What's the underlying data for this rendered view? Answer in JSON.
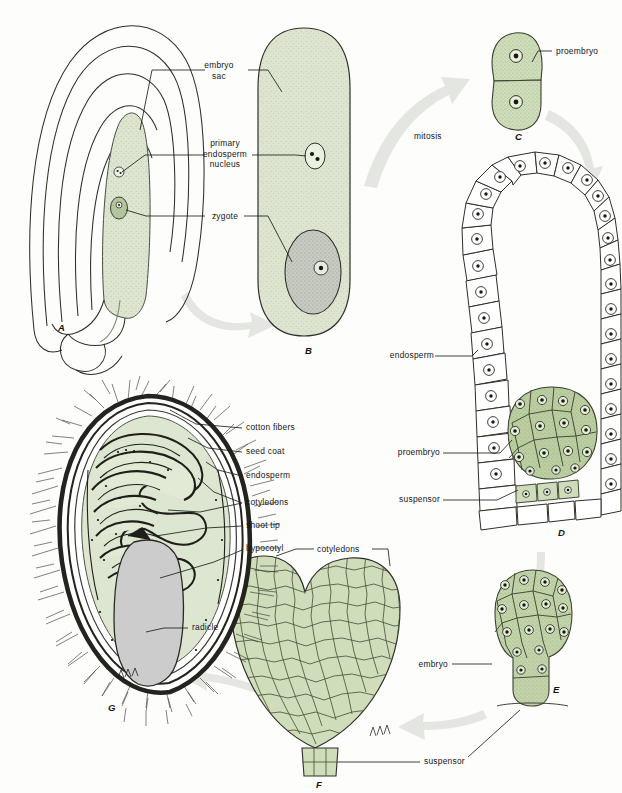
{
  "figure": {
    "domain": "biological-diagram"
  },
  "palette": {
    "cell_green": "#d5e0c4",
    "cell_green_dark": "#b8c9a0",
    "outline": "#2b2b22",
    "arrow_gray": "#e2e5df",
    "stipple": "#7a8c66",
    "radicle_gray": "#c9c9c9",
    "zygote_gray": "#c6c9c2",
    "background": "#fdfdfc",
    "text": "#15171a"
  },
  "stages": [
    {
      "id": "A",
      "letter": "A",
      "x": 58,
      "y": 322,
      "caption": "ovule with embryo sac"
    },
    {
      "id": "B",
      "letter": "B",
      "x": 305,
      "y": 345,
      "caption": "embryo sac enlarged"
    },
    {
      "id": "C",
      "letter": "C",
      "x": 515,
      "y": 131,
      "caption": "two-celled proembryo"
    },
    {
      "id": "D",
      "letter": "D",
      "x": 558,
      "y": 537,
      "caption": "proembryo within endosperm"
    },
    {
      "id": "E",
      "letter": "E",
      "x": 553,
      "y": 691,
      "caption": "globular embryo"
    },
    {
      "id": "F",
      "letter": "F",
      "x": 331,
      "y": 782,
      "caption": "heart-stage embryo"
    },
    {
      "id": "G",
      "letter": "G",
      "x": 108,
      "y": 706,
      "caption": "mature cotton seed"
    }
  ],
  "arrow_labels": [
    {
      "name": "mitosis",
      "text": "mitosis",
      "x": 414,
      "y": 135
    }
  ],
  "labels": [
    {
      "name": "embryo-sac",
      "text": "embryo\nsac",
      "lines": [
        "embryo",
        "sac"
      ],
      "x": 218,
      "y": 66,
      "align": "center"
    },
    {
      "name": "primary-endosperm-nucleus",
      "text": "primary endosperm nucleus",
      "lines": [
        "primary",
        "endosperm",
        "nucleus"
      ],
      "x": 210,
      "y": 143,
      "align": "center"
    },
    {
      "name": "zygote",
      "text": "zygote",
      "lines": [
        "zygote"
      ],
      "x": 213,
      "y": 213,
      "align": "center"
    },
    {
      "name": "proembryo-c",
      "text": "proembryo",
      "lines": [
        "proembryo"
      ],
      "x": 556,
      "y": 51,
      "align": "left"
    },
    {
      "name": "endosperm-d",
      "text": "endosperm",
      "lines": [
        "endosperm"
      ],
      "x": 386,
      "y": 353,
      "align": "left"
    },
    {
      "name": "proembryo-d",
      "text": "proembryo",
      "lines": [
        "proembryo"
      ],
      "x": 440,
      "y": 450,
      "align": "right"
    },
    {
      "name": "suspensor-d",
      "text": "suspensor",
      "lines": [
        "suspensor"
      ],
      "x": 440,
      "y": 497,
      "align": "right"
    },
    {
      "name": "cotton-fibers",
      "text": "cotton fibers",
      "lines": [
        "cotton fibers"
      ],
      "x": 245,
      "y": 428,
      "align": "left"
    },
    {
      "name": "seed-coat",
      "text": "seed coat",
      "lines": [
        "seed coat"
      ],
      "x": 245,
      "y": 452,
      "align": "left"
    },
    {
      "name": "endosperm-g",
      "text": "endosperm",
      "lines": [
        "endosperm"
      ],
      "x": 245,
      "y": 476,
      "align": "left"
    },
    {
      "name": "cotyledons-g",
      "text": "cotyledons",
      "lines": [
        "cotyledons"
      ],
      "x": 245,
      "y": 503,
      "align": "left"
    },
    {
      "name": "shoot-tip",
      "text": "shoot tip",
      "lines": [
        "shoot tip"
      ],
      "x": 245,
      "y": 525,
      "align": "left"
    },
    {
      "name": "hypocotyl",
      "text": "hypocotyl",
      "lines": [
        "hypocotyl"
      ],
      "x": 245,
      "y": 548,
      "align": "left"
    },
    {
      "name": "radicle",
      "text": "radicle",
      "lines": [
        "radicle"
      ],
      "x": 192,
      "y": 627,
      "align": "left"
    },
    {
      "name": "cotyledons-f",
      "text": "cotyledons",
      "lines": [
        "cotyledons"
      ],
      "x": 317,
      "y": 549,
      "align": "left"
    },
    {
      "name": "embryo-e",
      "text": "embryo",
      "lines": [
        "embryo"
      ],
      "x": 448,
      "y": 663,
      "align": "right"
    },
    {
      "name": "suspensor-f",
      "text": "suspensor",
      "lines": [
        "suspensor"
      ],
      "x": 425,
      "y": 760,
      "align": "left"
    }
  ]
}
